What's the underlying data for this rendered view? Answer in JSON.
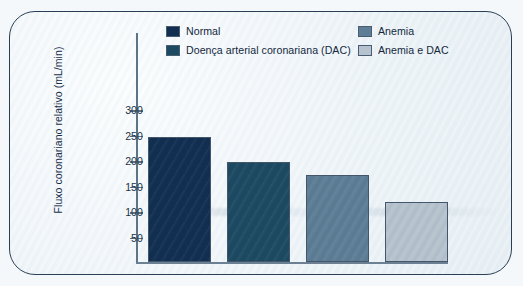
{
  "chart_data": {
    "type": "bar",
    "title": "",
    "subtitle": "",
    "xlabel": "",
    "ylabel": "Fluxo coronariano relativo (mL/min)",
    "categories": [
      "Normal",
      "Doença arterial coronariana (DAC)",
      "Anemia",
      "Anemia e DAC"
    ],
    "values": [
      250,
      200,
      175,
      122
    ],
    "ylim": [
      0,
      320
    ],
    "yticks": [
      50,
      100,
      150,
      200,
      250,
      300
    ],
    "ytick_labels": [
      "50",
      "100",
      "150",
      "200",
      "250",
      "300"
    ],
    "xtick_labels": [],
    "grid": false,
    "legend_position": "top",
    "series": [
      {
        "name": "Normal",
        "value": 250,
        "color": "#122f52"
      },
      {
        "name": "Doença arterial coronariana (DAC)",
        "value": 200,
        "color": "#1d4a63"
      },
      {
        "name": "Anemia",
        "value": 175,
        "color": "#5d7e96"
      },
      {
        "name": "Anemia e DAC",
        "value": 122,
        "color": "#b6c3ce"
      }
    ],
    "annotations": []
  },
  "legend": {
    "items": [
      {
        "label": "Normal",
        "color": "#122f52"
      },
      {
        "label": "Doença arterial coronariana (DAC)",
        "color": "#1d4a63"
      },
      {
        "label": "Anemia",
        "color": "#5d7e96"
      },
      {
        "label": "Anemia e DAC",
        "color": "#b6c3ce"
      }
    ]
  },
  "axis": {
    "y_title": "Fluxo coronariano relativo (mL/min)",
    "ticks": [
      "300",
      "250",
      "200",
      "150",
      "100",
      "50"
    ]
  },
  "colors": {
    "axis": "#5d7486",
    "text": "#13283d",
    "frame": "#2a3f55",
    "paper": "#eef4f8"
  }
}
